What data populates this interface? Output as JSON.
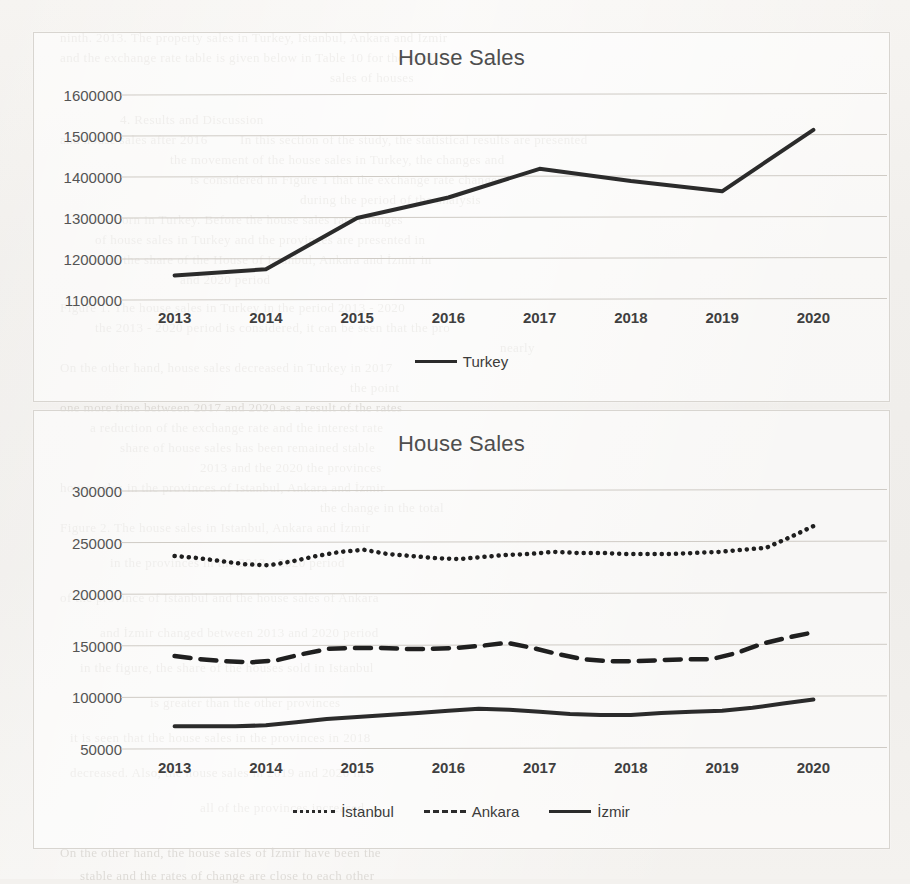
{
  "page": {
    "background_color": "#f1efec",
    "scan_artifacts": [
      {
        "text": "ninth. 2013. The property sales in Turkey, Istanbul, Ankara and İzmir",
        "x": 60,
        "y": 30
      },
      {
        "text": "and the exchange rate table is given below in Table 10 for the total",
        "x": 60,
        "y": 50
      },
      {
        "text": "sales of houses",
        "x": 330,
        "y": 70
      },
      {
        "text": "4. Results and Discussion",
        "x": 120,
        "y": 112
      },
      {
        "text": "and house sales after 2016",
        "x": 60,
        "y": 132
      },
      {
        "text": "In this section of the study, the statistical results are presented",
        "x": 240,
        "y": 132
      },
      {
        "text": "the movement of the house sales in Turkey, the changes and",
        "x": 170,
        "y": 152
      },
      {
        "text": "is considered in Figure 1 that the exchange rate changes",
        "x": 190,
        "y": 172
      },
      {
        "text": "during the period of the analysis",
        "x": 300,
        "y": 192
      },
      {
        "text": "was born in Turkey. Before the house sales rate changes",
        "x": 90,
        "y": 212
      },
      {
        "text": "of house sales in Turkey and the provinces are presented in",
        "x": 95,
        "y": 232
      },
      {
        "text": "with the share of the House of Istanbul, Ankara and İzmir in",
        "x": 95,
        "y": 252
      },
      {
        "text": "and 2020 period",
        "x": 180,
        "y": 272
      },
      {
        "text": "Figure 1. The house sales in Turkey in the period 2013 - 2020",
        "x": 60,
        "y": 300
      },
      {
        "text": "the 2013 - 2020 period is considered, it can be seen that the pro",
        "x": 95,
        "y": 320
      },
      {
        "text": "nearly",
        "x": 500,
        "y": 340
      },
      {
        "text": "On the other hand, house sales decreased in Turkey in 2017",
        "x": 60,
        "y": 360
      },
      {
        "text": "the point",
        "x": 350,
        "y": 380
      },
      {
        "text": "one more time between 2017 and 2020 as a result of the rates",
        "x": 60,
        "y": 400
      },
      {
        "text": "a reduction of the exchange rate and the interest rate",
        "x": 90,
        "y": 420
      },
      {
        "text": "share of house sales has been remained stable",
        "x": 120,
        "y": 440
      },
      {
        "text": "2013 and the 2020 the provinces",
        "x": 200,
        "y": 460
      },
      {
        "text": "house sales in the provinces of Istanbul, Ankara and İzmir",
        "x": 60,
        "y": 480
      },
      {
        "text": "the change in the total",
        "x": 320,
        "y": 500
      },
      {
        "text": "Figure 2. The house sales in Istanbul, Ankara and İzmir",
        "x": 60,
        "y": 520
      },
      {
        "text": "in the provinces in the 2013 - 2020 period",
        "x": 110,
        "y": 555
      },
      {
        "text": "of the province of Istanbul and the house sales of Ankara",
        "x": 60,
        "y": 590
      },
      {
        "text": "and İzmir changed between 2013 and 2020 period",
        "x": 100,
        "y": 625
      },
      {
        "text": "in the figure, the share of the houses sold in Istanbul",
        "x": 80,
        "y": 660
      },
      {
        "text": "is greater than the other provinces",
        "x": 150,
        "y": 695
      },
      {
        "text": "it is seen that the house sales in the provinces in 2018",
        "x": 70,
        "y": 730
      },
      {
        "text": "decreased. Also, the house sales in 2019 and 2020 in",
        "x": 70,
        "y": 765
      },
      {
        "text": "all of the provinces increased",
        "x": 200,
        "y": 800
      },
      {
        "text": "On the other hand, the house sales of İzmir have been the",
        "x": 60,
        "y": 845
      },
      {
        "text": "stable and the rates of change are close to each other",
        "x": 80,
        "y": 868
      }
    ]
  },
  "chart_data": [
    {
      "id": "chart1",
      "type": "line",
      "title": "House Sales",
      "xlabel": "",
      "ylabel": "",
      "categories": [
        "2013",
        "2014",
        "2015",
        "2016",
        "2017",
        "2018",
        "2019",
        "2020"
      ],
      "ylim": [
        1100000,
        1600000
      ],
      "yticks": [
        1100000,
        1200000,
        1300000,
        1400000,
        1500000,
        1600000
      ],
      "ytick_labels": [
        "1100000",
        "1200000",
        "1300000",
        "1400000",
        "1500000",
        "1600000"
      ],
      "grid": true,
      "legend_position": "bottom",
      "series": [
        {
          "name": "Turkey",
          "style": "solid",
          "color": "#2b2b2b",
          "values": [
            1160000,
            1175000,
            1300000,
            1350000,
            1420000,
            1390000,
            1365000,
            1515000
          ]
        }
      ]
    },
    {
      "id": "chart2",
      "type": "line",
      "title": "House Sales",
      "xlabel": "",
      "ylabel": "",
      "categories": [
        "2013",
        "2014",
        "2015",
        "2016",
        "2017",
        "2018",
        "2019",
        "2020"
      ],
      "ylim": [
        50000,
        300000
      ],
      "yticks": [
        50000,
        100000,
        150000,
        200000,
        250000,
        300000
      ],
      "ytick_labels": [
        "50000",
        "100000",
        "150000",
        "200000",
        "250000",
        "300000"
      ],
      "grid": true,
      "legend_position": "bottom",
      "series": [
        {
          "name": "İstanbul",
          "style": "dotted",
          "color": "#1f1f1f",
          "values": [
            237000,
            235000,
            232000,
            229000,
            228000,
            232000,
            237000,
            241000,
            243000,
            239000,
            237000,
            235000,
            234000,
            236000,
            238000,
            239000,
            241000,
            240000,
            240000,
            239000,
            239000,
            239000,
            240000,
            241000,
            243000,
            245000,
            255000,
            266000
          ]
        },
        {
          "name": "Ankara",
          "style": "dashed",
          "color": "#1f1f1f",
          "values": [
            140000,
            137000,
            135000,
            134000,
            136000,
            142000,
            147000,
            148000,
            148000,
            147000,
            147000,
            148000,
            150000,
            153000,
            148000,
            142000,
            137000,
            135000,
            135000,
            136000,
            137000,
            137000,
            143000,
            152000,
            158000,
            163000
          ]
        },
        {
          "name": "İzmir",
          "style": "solid",
          "color": "#2b2b2b",
          "values": [
            72000,
            72000,
            72000,
            73000,
            76000,
            79000,
            81000,
            83000,
            85000,
            87000,
            89000,
            88000,
            86000,
            84000,
            83000,
            83000,
            85000,
            86000,
            87000,
            90000,
            94000,
            98000
          ]
        }
      ]
    }
  ]
}
